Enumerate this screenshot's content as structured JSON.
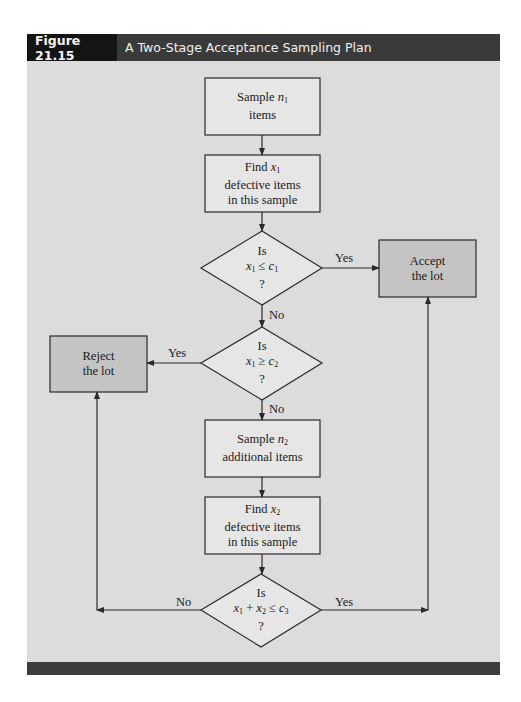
{
  "figure": {
    "label": "Figure 21.15",
    "title": "A Two-Stage Acceptance Sampling Plan"
  },
  "colors": {
    "panel_bg": "#dcdcdc",
    "process_fill": "#e6e6e6",
    "terminal_fill": "#c4c4c4",
    "stroke": "#2a2a2a",
    "header_dark": "#141414",
    "header_bg": "#3a3a3a"
  },
  "nodes": {
    "sample_n1": {
      "line1_prefix": "Sample ",
      "var": "n",
      "sub": "1",
      "line2": "items"
    },
    "find_x1": {
      "line1_prefix": "Find ",
      "var": "x",
      "sub": "1",
      "line2": "defective items",
      "line3": "in this sample"
    },
    "decision1": {
      "line1": "Is",
      "var_a": "x",
      "sub_a": "1",
      "op": " ≤ ",
      "var_b": "c",
      "sub_b": "1",
      "line3": "?"
    },
    "accept": {
      "line1": "Accept",
      "line2": "the lot"
    },
    "decision2": {
      "line1": "Is",
      "var_a": "x",
      "sub_a": "1",
      "op": " ≥ ",
      "var_b": "c",
      "sub_b": "2",
      "line3": "?"
    },
    "reject": {
      "line1": "Reject",
      "line2": "the lot"
    },
    "sample_n2": {
      "line1_prefix": "Sample ",
      "var": "n",
      "sub": "2",
      "line2": "additional items"
    },
    "find_x2": {
      "line1_prefix": "Find ",
      "var": "x",
      "sub": "2",
      "line2": "defective items",
      "line3": "in this sample"
    },
    "decision3": {
      "line1": "Is",
      "var_a": "x",
      "sub_a": "1",
      "plus": " + ",
      "var_c": "x",
      "sub_c": "2",
      "op": " ≤ ",
      "var_b": "c",
      "sub_b": "3",
      "line3": "?"
    }
  },
  "edges": {
    "d1_yes": "Yes",
    "d1_no": "No",
    "d2_yes": "Yes",
    "d2_no": "No",
    "d3_no": "No",
    "d3_yes": "Yes"
  }
}
